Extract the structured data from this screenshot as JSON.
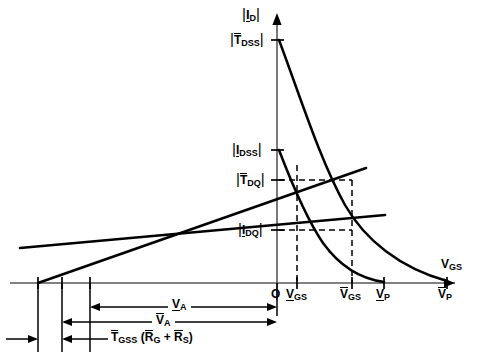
{
  "figure": {
    "title_semantics": "JFET transfer characteristic bias design graph",
    "axes": {
      "y_axis_label": "|I",
      "y_axis_label_sub": "D",
      "y_axis_label_close": "|",
      "x_axis_label": "V",
      "x_axis_label_sub": "GS",
      "origin_label": "O"
    },
    "y_ticks": [
      {
        "id": "idss_max",
        "prefix": "|",
        "sym": "T",
        "sub": "DSS",
        "suffix": "|",
        "bar": "over",
        "y": 40
      },
      {
        "id": "idss_min",
        "prefix": "|",
        "sym": "I",
        "sub": "DSS",
        "suffix": "|",
        "bar": "under",
        "y": 150
      },
      {
        "id": "idq_max",
        "prefix": "|",
        "sym": "T",
        "sub": "DQ",
        "suffix": "|",
        "bar": "over",
        "y": 180
      },
      {
        "id": "idq_min",
        "prefix": "|",
        "sym": "I",
        "sub": "DQ",
        "suffix": "|",
        "bar": "under",
        "y": 230
      }
    ],
    "x_ticks": [
      {
        "id": "vgs_min",
        "sym": "V",
        "sub": "GS",
        "bar": "under",
        "x": 297
      },
      {
        "id": "vgs_max",
        "sym": "V",
        "sub": "GS",
        "bar": "over",
        "x": 352
      },
      {
        "id": "vp_min",
        "sym": "V",
        "sub": "P",
        "bar": "under",
        "x": 384
      },
      {
        "id": "vp_max",
        "sym": "V",
        "sub": "P",
        "bar": "over",
        "x": 447
      }
    ],
    "dimensions": [
      {
        "id": "va_min",
        "sym": "V",
        "sub": "A",
        "bar": "under",
        "prefix": "",
        "suffix": ""
      },
      {
        "id": "va_max",
        "sym": "V",
        "sub": "A",
        "bar": "over",
        "prefix": "",
        "suffix": ""
      },
      {
        "id": "tgss_rg_rs",
        "text_parts": [
          "T",
          "GSS",
          " (",
          "R",
          "G",
          " + ",
          "R",
          "S",
          ")"
        ]
      }
    ],
    "curves": [
      {
        "id": "transfer-curve-max",
        "note": "upper transfer characteristic, from |T_DSS| to V_P max"
      },
      {
        "id": "transfer-curve-min",
        "note": "lower transfer characteristic, from |I_DSS| to V_P min"
      },
      {
        "id": "bias-load-line-upper",
        "note": "steeper bias line from left tick"
      },
      {
        "id": "bias-load-line-lower",
        "note": "shallower bias line from right tick"
      }
    ],
    "colors": {
      "ink": "#000000",
      "background": "#ffffff",
      "axis": "#4a4a4a"
    }
  }
}
